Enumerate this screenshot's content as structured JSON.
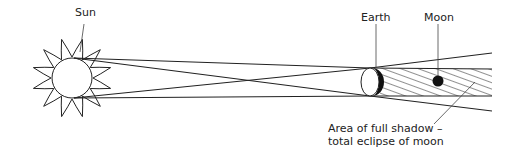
{
  "labels": {
    "sun": "Sun",
    "earth": "Earth",
    "moon": "Moon",
    "umbra_line1": "Area of full shadow –",
    "umbra_line2": "total eclipse of moon"
  },
  "colors": {
    "ink": "#222222",
    "background": "#ffffff"
  }
}
